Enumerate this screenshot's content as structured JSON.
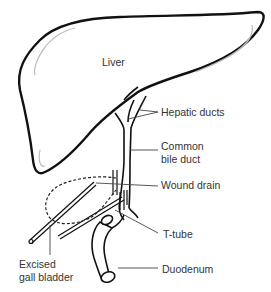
{
  "diagram": {
    "labels": {
      "liver": "Liver",
      "hepatic_ducts": "Hepatic ducts",
      "common_bile_duct_line1": "Common",
      "common_bile_duct_line2": "bile duct",
      "wound_drain": "Wound drain",
      "t_tube": "T-tube",
      "excised_gall_bladder_line1": "Excised",
      "excised_gall_bladder_line2": "gall bladder",
      "duodenum": "Duodenum"
    },
    "colors": {
      "outline": "#111111",
      "shading": "#bbbbbb",
      "leader": "#444444",
      "text": "#333333"
    }
  }
}
